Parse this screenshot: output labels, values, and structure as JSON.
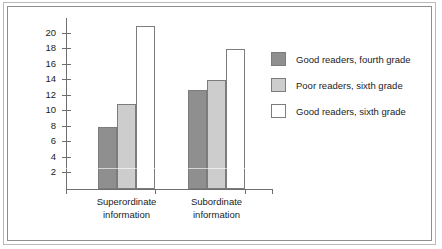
{
  "chart_data": {
    "type": "bar",
    "title": "",
    "xlabel": "",
    "ylabel": "Percentage of idea units recalled",
    "categories": [
      "Superordinate information",
      "Subordinate information"
    ],
    "category_lines": [
      [
        "Superordinate",
        "information"
      ],
      [
        "Subordinate",
        "information"
      ]
    ],
    "series": [
      {
        "name": "Good readers, fourth grade",
        "color": "#8f8f8f",
        "values": [
          8,
          12.8
        ]
      },
      {
        "name": "Poor readers, sixth grade",
        "color": "#cdcdcd",
        "values": [
          11,
          14
        ]
      },
      {
        "name": "Good readers, sixth grade",
        "color": "#ffffff",
        "values": [
          21,
          18
        ]
      }
    ],
    "ylim": [
      0,
      22
    ],
    "yticks": [
      2,
      4,
      6,
      8,
      10,
      12,
      14,
      16,
      18,
      20
    ],
    "ytick_labels": [
      "2",
      "4",
      "6",
      "8",
      "10",
      "12",
      "14",
      "16",
      "18",
      "20"
    ],
    "grid": false,
    "legend_position": "right"
  },
  "legend": {
    "items": [
      {
        "label": "Good readers, fourth grade",
        "swatch": "dark"
      },
      {
        "label": "Poor readers, sixth grade",
        "swatch": "light"
      },
      {
        "label": "Good readers, sixth grade",
        "swatch": "white"
      }
    ]
  }
}
